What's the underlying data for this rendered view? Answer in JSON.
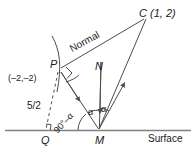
{
  "figure": {
    "kind": "geometry-diagram",
    "title_visible": false,
    "background_color": "#ffffff",
    "stroke_color": "#4d4d4d",
    "text_color": "#1a1a1a",
    "labels": {
      "point_c": "C (1, 2)",
      "point_p": "P",
      "point_p_coords": "(–2,–2)",
      "point_n": "N",
      "point_m": "M",
      "point_q": "Q",
      "normal": "Normal",
      "surface": "Surface",
      "distance_pq": "5/2",
      "angle_alpha_left": "α",
      "angle_alpha_right": "α",
      "angle_complement": "90°–α"
    },
    "points": {
      "C": {
        "x": 146,
        "y": 17
      },
      "P": {
        "x": 60,
        "y": 70
      },
      "M": {
        "x": 99,
        "y": 130
      },
      "Q": {
        "x": 46,
        "y": 130
      },
      "N_top": {
        "x": 101,
        "y": 62
      }
    },
    "segments": [
      {
        "name": "normal-line-pc",
        "from": "P",
        "to": "C"
      },
      {
        "name": "incident-ray-pm",
        "from": "P",
        "to": "M"
      },
      {
        "name": "reflected-ray-mc",
        "from": "M",
        "to": "C"
      },
      {
        "name": "normal-axis-nm",
        "from": "N_top",
        "to": "M"
      },
      {
        "name": "surface-line",
        "from": "left",
        "to": "right"
      },
      {
        "name": "dashed-drop-pq",
        "from": "P",
        "to": "Q"
      }
    ],
    "markers": {
      "right_angle_at_p": true,
      "right_angle_at_q": true,
      "arc_through_p": true,
      "arrow_on_pm": true,
      "arrow_on_mc": true,
      "arrow_on_nm": true,
      "angle_arcs_at_m": 3
    }
  }
}
